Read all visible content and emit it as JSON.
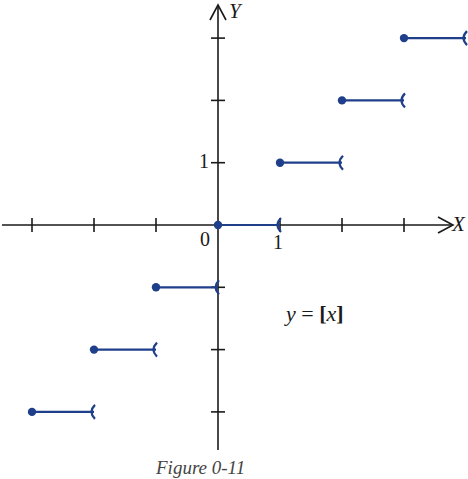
{
  "chart_data": {
    "type": "line",
    "subtype": "step-function",
    "title": "",
    "caption": "Figure 0-11",
    "equation_label": "y = [x]",
    "xlabel": "X",
    "ylabel": "Y",
    "origin_label": "0",
    "x_tick_labels": [
      {
        "value": 1,
        "label": "1"
      }
    ],
    "y_tick_labels": [
      {
        "value": 1,
        "label": "1"
      }
    ],
    "x_ticks": [
      -3,
      -2,
      -1,
      1,
      2,
      3
    ],
    "y_ticks": [
      -3,
      -2,
      -1,
      1,
      2,
      3
    ],
    "xlim": [
      -3.5,
      4
    ],
    "ylim": [
      -3.5,
      3.5
    ],
    "grid": false,
    "legend": null,
    "series": [
      {
        "name": "greatest integer function",
        "color": "#1f3f8a",
        "segments": [
          {
            "x_start": -3,
            "x_end": -2,
            "y": -3,
            "closed_left": true,
            "open_right": true
          },
          {
            "x_start": -2,
            "x_end": -1,
            "y": -2,
            "closed_left": true,
            "open_right": true
          },
          {
            "x_start": -1,
            "x_end": 0,
            "y": -1,
            "closed_left": true,
            "open_right": true
          },
          {
            "x_start": 0,
            "x_end": 1,
            "y": 0,
            "closed_left": true,
            "open_right": true
          },
          {
            "x_start": 1,
            "x_end": 2,
            "y": 1,
            "closed_left": true,
            "open_right": true
          },
          {
            "x_start": 2,
            "x_end": 3,
            "y": 2,
            "closed_left": true,
            "open_right": true
          },
          {
            "x_start": 3,
            "x_end": 4,
            "y": 3,
            "closed_left": true,
            "open_right": true
          }
        ]
      }
    ]
  },
  "labels": {
    "x_axis": "X",
    "y_axis": "Y",
    "origin": "0",
    "x_one": "1",
    "y_one": "1",
    "equation_y": "y",
    "equation_eq": " = ",
    "equation_rhs_open": "[",
    "equation_rhs_var": "x",
    "equation_rhs_close": "]",
    "caption": "Figure 0-11"
  },
  "colors": {
    "axis": "#1a1a1a",
    "step": "#1f3f8a"
  }
}
